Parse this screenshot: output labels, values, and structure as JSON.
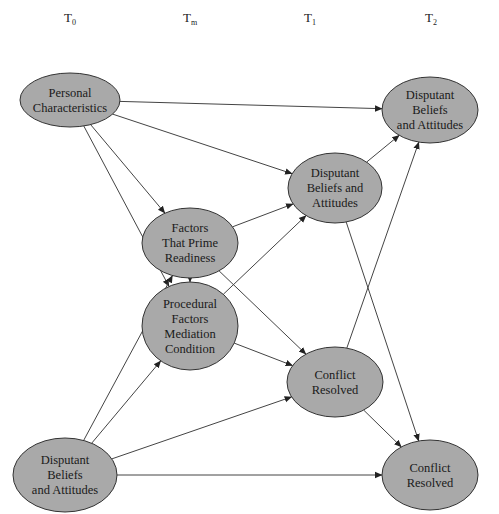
{
  "time_points": [
    {
      "id": "t0",
      "base": "T",
      "sub": "0"
    },
    {
      "id": "tm",
      "base": "T",
      "sub": "m"
    },
    {
      "id": "t1",
      "base": "T",
      "sub": "1"
    },
    {
      "id": "t2",
      "base": "T",
      "sub": "2"
    }
  ],
  "nodes": [
    {
      "id": "personal-characteristics",
      "time": "T0",
      "lines": [
        "Personal",
        "Characteristics"
      ]
    },
    {
      "id": "disputant-beliefs-t2",
      "time": "T2",
      "lines": [
        "Disputant",
        "Beliefs",
        "and Attitudes"
      ]
    },
    {
      "id": "disputant-beliefs-t1",
      "time": "T1",
      "lines": [
        "Disputant",
        "Beliefs and",
        "Attitudes"
      ]
    },
    {
      "id": "factors-prime-readiness",
      "time": "Tm",
      "lines": [
        "Factors",
        "That Prime",
        "Readiness"
      ]
    },
    {
      "id": "procedural-factors",
      "time": "Tm",
      "lines": [
        "Procedural",
        "Factors",
        "Mediation",
        "Condition"
      ]
    },
    {
      "id": "conflict-resolved-t1",
      "time": "T1",
      "lines": [
        "Conflict",
        "Resolved"
      ]
    },
    {
      "id": "disputant-beliefs-t0",
      "time": "T0",
      "lines": [
        "Disputant",
        "Beliefs",
        "and Attitudes"
      ]
    },
    {
      "id": "conflict-resolved-t2",
      "time": "T2",
      "lines": [
        "Conflict",
        "Resolved"
      ]
    }
  ],
  "edges": [
    {
      "from": "personal-characteristics",
      "to": "disputant-beliefs-t2"
    },
    {
      "from": "personal-characteristics",
      "to": "disputant-beliefs-t1"
    },
    {
      "from": "personal-characteristics",
      "to": "factors-prime-readiness"
    },
    {
      "from": "personal-characteristics",
      "to": "procedural-factors"
    },
    {
      "from": "factors-prime-readiness",
      "to": "procedural-factors"
    },
    {
      "from": "factors-prime-readiness",
      "to": "disputant-beliefs-t1"
    },
    {
      "from": "factors-prime-readiness",
      "to": "conflict-resolved-t1"
    },
    {
      "from": "procedural-factors",
      "to": "disputant-beliefs-t1"
    },
    {
      "from": "procedural-factors",
      "to": "conflict-resolved-t1"
    },
    {
      "from": "disputant-beliefs-t1",
      "to": "disputant-beliefs-t2"
    },
    {
      "from": "disputant-beliefs-t1",
      "to": "conflict-resolved-t2"
    },
    {
      "from": "conflict-resolved-t1",
      "to": "disputant-beliefs-t2"
    },
    {
      "from": "conflict-resolved-t1",
      "to": "conflict-resolved-t2"
    },
    {
      "from": "disputant-beliefs-t0",
      "to": "factors-prime-readiness"
    },
    {
      "from": "disputant-beliefs-t0",
      "to": "procedural-factors"
    },
    {
      "from": "disputant-beliefs-t0",
      "to": "conflict-resolved-t1"
    },
    {
      "from": "disputant-beliefs-t0",
      "to": "conflict-resolved-t2"
    }
  ],
  "colors": {
    "node_fill": "#a9a9a9",
    "node_stroke": "#333333",
    "edge": "#444444"
  }
}
